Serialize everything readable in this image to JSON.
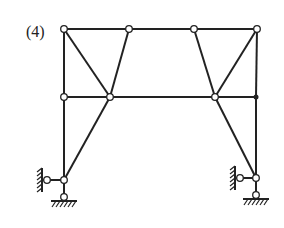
{
  "figure": {
    "label": "(4)",
    "type": "truss structure diagram",
    "colors": {
      "line": "#222222",
      "hinge_fill": "#ffffff",
      "background": "#ffffff"
    }
  },
  "nodes": [
    {
      "id": "T1",
      "x": 64,
      "y": 29,
      "type": "hinge"
    },
    {
      "id": "T2",
      "x": 129,
      "y": 29,
      "type": "hinge"
    },
    {
      "id": "T3",
      "x": 194,
      "y": 29,
      "type": "hinge"
    },
    {
      "id": "T4",
      "x": 257,
      "y": 29,
      "type": "hinge"
    },
    {
      "id": "M1",
      "x": 64,
      "y": 97,
      "type": "hinge"
    },
    {
      "id": "M2",
      "x": 110,
      "y": 97,
      "type": "hinge"
    },
    {
      "id": "M3",
      "x": 215,
      "y": 97,
      "type": "hinge"
    },
    {
      "id": "M4",
      "x": 256,
      "y": 97,
      "type": "rigid"
    },
    {
      "id": "B1",
      "x": 64,
      "y": 180,
      "type": "hinge"
    },
    {
      "id": "S1",
      "x": 47,
      "y": 180,
      "type": "hinge"
    },
    {
      "id": "G1",
      "x": 64,
      "y": 197,
      "type": "hinge"
    },
    {
      "id": "B2",
      "x": 256,
      "y": 178,
      "type": "hinge"
    },
    {
      "id": "S2",
      "x": 240,
      "y": 178,
      "type": "hinge"
    },
    {
      "id": "G2",
      "x": 256,
      "y": 195,
      "type": "hinge"
    }
  ],
  "members": [
    [
      "T1",
      "T2"
    ],
    [
      "T2",
      "T3"
    ],
    [
      "T3",
      "T4"
    ],
    [
      "T1",
      "M1"
    ],
    [
      "M1",
      "B1"
    ],
    [
      "T1",
      "M2"
    ],
    [
      "T2",
      "M2"
    ],
    [
      "M1",
      "M2"
    ],
    [
      "M2",
      "M3"
    ],
    [
      "M3",
      "M4"
    ],
    [
      "T3",
      "M3"
    ],
    [
      "T4",
      "M3"
    ],
    [
      "T4",
      "M4"
    ],
    [
      "M4",
      "B2"
    ],
    [
      "M2",
      "B1"
    ],
    [
      "M3",
      "B2"
    ],
    [
      "B1",
      "S1"
    ],
    [
      "B1",
      "G1"
    ],
    [
      "B2",
      "S2"
    ],
    [
      "B2",
      "G2"
    ]
  ],
  "supports": [
    {
      "id": "left-wall",
      "node": "S1",
      "orientation": "vertical-wall"
    },
    {
      "id": "left-ground",
      "node": "G1",
      "orientation": "ground"
    },
    {
      "id": "right-wall",
      "node": "S2",
      "orientation": "vertical-wall"
    },
    {
      "id": "right-ground",
      "node": "G2",
      "orientation": "ground"
    }
  ]
}
